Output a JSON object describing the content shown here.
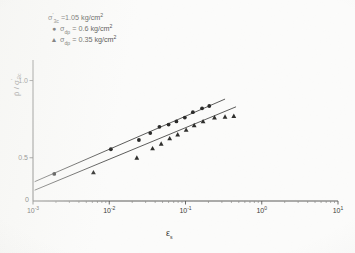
{
  "figure": {
    "background_color": "#fbfbfa",
    "ink_color": "#3b3b39"
  },
  "legend": {
    "header": {
      "symbol_main": "σ",
      "prime": "'",
      "subscript": "3c",
      "equals_value": " =1.05 kg/cm",
      "exponent": "2"
    },
    "entries": [
      {
        "marker": "●",
        "marker_name": "filled-circle",
        "symbol_main": "σ",
        "subscript": "dp",
        "equals_value": " = 0.6 kg/cm",
        "exponent": "2"
      },
      {
        "marker": "▲",
        "marker_name": "filled-triangle",
        "symbol_main": "σ",
        "subscript": "dp",
        "equals_value": " = 0.35 kg/cm",
        "exponent": "2"
      }
    ]
  },
  "axes": {
    "y_label_main": "p̄",
    "y_label_sep": " / ",
    "y_label_den": "σ",
    "y_label_den_prime": "'",
    "y_label_den_sub": "3c",
    "x_label": "ε",
    "x_label_sub": "s",
    "y_ticks": [
      {
        "value": 0.5,
        "label": "0.5"
      },
      {
        "value": 1.0,
        "label": "1.0"
      }
    ],
    "x_ticks": [
      {
        "value": -3,
        "mantissa": "10",
        "exponent": "-3"
      },
      {
        "value": -2,
        "mantissa": "10",
        "exponent": "-2"
      },
      {
        "value": -1,
        "mantissa": "10",
        "exponent": "-1"
      },
      {
        "value": 0,
        "mantissa": "10",
        "exponent": "0"
      },
      {
        "value": 1,
        "mantissa": "10",
        "exponent": "1"
      }
    ],
    "x_zero_marker": "0"
  },
  "chart_data": {
    "type": "scatter",
    "title": "",
    "xlabel": "εs",
    "ylabel": "p̄ / σ'3c",
    "xscale": "log",
    "xlim": [
      0.001,
      10
    ],
    "ylim": [
      0.22,
      1.12
    ],
    "grid": false,
    "legend_position": "upper-left",
    "annotations": [
      "σ'3c = 1.05 kg/cm2"
    ],
    "series": [
      {
        "name": "σdp = 0.6 kg/cm2",
        "marker": "filled-circle",
        "color": "#2b2b2a",
        "points": [
          {
            "x": 0.0019,
            "y": 0.395
          },
          {
            "x": 0.0105,
            "y": 0.555
          },
          {
            "x": 0.0245,
            "y": 0.615
          },
          {
            "x": 0.0345,
            "y": 0.66
          },
          {
            "x": 0.0455,
            "y": 0.7
          },
          {
            "x": 0.06,
            "y": 0.715
          },
          {
            "x": 0.076,
            "y": 0.735
          },
          {
            "x": 0.098,
            "y": 0.76
          },
          {
            "x": 0.125,
            "y": 0.795
          },
          {
            "x": 0.165,
            "y": 0.82
          },
          {
            "x": 0.205,
            "y": 0.835
          }
        ],
        "fit_line": {
          "x_start": 0.00105,
          "y_start": 0.345,
          "x_end": 0.33,
          "y_end": 0.88
        }
      },
      {
        "name": "σdp = 0.35 kg/cm2",
        "marker": "filled-triangle",
        "color": "#2f2f2d",
        "points": [
          {
            "x": 0.0062,
            "y": 0.405
          },
          {
            "x": 0.023,
            "y": 0.5
          },
          {
            "x": 0.037,
            "y": 0.56
          },
          {
            "x": 0.048,
            "y": 0.59
          },
          {
            "x": 0.062,
            "y": 0.625
          },
          {
            "x": 0.079,
            "y": 0.65
          },
          {
            "x": 0.102,
            "y": 0.68
          },
          {
            "x": 0.13,
            "y": 0.71
          },
          {
            "x": 0.17,
            "y": 0.735
          },
          {
            "x": 0.24,
            "y": 0.76
          },
          {
            "x": 0.33,
            "y": 0.765
          },
          {
            "x": 0.43,
            "y": 0.77
          }
        ],
        "fit_line": {
          "x_start": 0.00105,
          "y_start": 0.29,
          "x_end": 0.46,
          "y_end": 0.83
        }
      }
    ]
  }
}
